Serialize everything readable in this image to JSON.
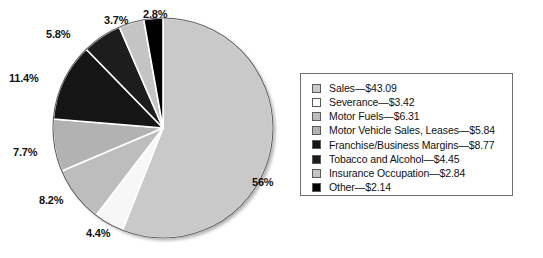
{
  "chart_data": {
    "type": "pie",
    "title": "",
    "subtitle": "",
    "xlabel": "",
    "ylabel": "",
    "legend_position": "right",
    "grid": false,
    "value_unit": "billions of dollars",
    "categories": [
      "Sales",
      "Severance",
      "Motor Fuels",
      "Motor Vehicle Sales, Leases",
      "Franchise/Business Margins",
      "Tobacco and Alcohol",
      "Insurance Occupation",
      "Other"
    ],
    "values": [
      43.09,
      3.42,
      6.31,
      5.84,
      8.77,
      4.45,
      2.84,
      2.14
    ],
    "percent_labels": [
      "56%",
      "4.4%",
      "8.2%",
      "7.7%",
      "11.4%",
      "5.8%",
      "3.7%",
      "2.8%"
    ],
    "percents": [
      56.0,
      4.4,
      8.2,
      7.7,
      11.4,
      5.8,
      3.7,
      2.8
    ],
    "colors": [
      "#c9c9c9",
      "#f7f7f7",
      "#bdbdbd",
      "#b2b2b2",
      "#151515",
      "#1d1d1d",
      "#c4c4c4",
      "#000000"
    ],
    "slice_order_clockwise_from_top": [
      "Sales",
      "Severance",
      "Motor Fuels",
      "Motor Vehicle Sales, Leases",
      "Franchise/Business Margins",
      "Tobacco and Alcohol",
      "Insurance Occupation",
      "Other"
    ]
  },
  "pie": {
    "slices": [
      {
        "name": "sales",
        "label": "Sales",
        "pct_text": "56%",
        "pct": 56.0,
        "color": "#c9c9c9"
      },
      {
        "name": "severance",
        "label": "Severance",
        "pct_text": "4.4%",
        "pct": 4.4,
        "color": "#f7f7f7"
      },
      {
        "name": "motor-fuels",
        "label": "Motor Fuels",
        "pct_text": "8.2%",
        "pct": 8.2,
        "color": "#bdbdbd"
      },
      {
        "name": "motor-vehicle",
        "label": "Motor Vehicle Sales, Leases",
        "pct_text": "7.7%",
        "pct": 7.7,
        "color": "#b2b2b2"
      },
      {
        "name": "franchise",
        "label": "Franchise/Business Margins",
        "pct_text": "11.4%",
        "pct": 11.4,
        "color": "#151515"
      },
      {
        "name": "tobacco",
        "label": "Tobacco and Alcohol",
        "pct_text": "5.8%",
        "pct": 5.8,
        "color": "#1d1d1d"
      },
      {
        "name": "insurance",
        "label": "Insurance Occupation",
        "pct_text": "3.7%",
        "pct": 3.7,
        "color": "#c4c4c4"
      },
      {
        "name": "other",
        "label": "Other",
        "pct_text": "2.8%",
        "pct": 2.8,
        "color": "#000000"
      }
    ],
    "labels": {
      "sales": "56%",
      "severance": "4.4%",
      "motor_fuels": "8.2%",
      "motor_vehicle": "7.7%",
      "franchise": "11.4%",
      "tobacco": "5.8%",
      "insurance": "3.7%",
      "other": "2.8%"
    }
  },
  "legend": {
    "items": [
      {
        "label": "Sales—$43.09",
        "color": "#c9c9c9"
      },
      {
        "label": "Severance—$3.42",
        "color": "#ffffff"
      },
      {
        "label": "Motor Fuels—$6.31",
        "color": "#bdbdbd"
      },
      {
        "label": "Motor Vehicle Sales, Leases—$5.84",
        "color": "#b2b2b2"
      },
      {
        "label": "Franchise/Business Margins—$8.77",
        "color": "#151515"
      },
      {
        "label": "Tobacco and Alcohol—$4.45",
        "color": "#1d1d1d"
      },
      {
        "label": "Insurance Occupation—$2.84",
        "color": "#c4c4c4"
      },
      {
        "label": "Other—$2.14",
        "color": "#000000"
      }
    ]
  }
}
